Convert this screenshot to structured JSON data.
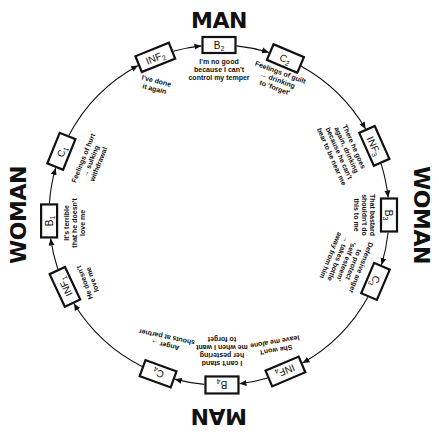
{
  "center": {
    "x": 219,
    "y": 215
  },
  "radius": 170,
  "colors": {
    "ink": "#111111",
    "background": "#ffffff"
  },
  "party_labels": [
    {
      "id": "top",
      "text": "MAN",
      "x": 219,
      "y": 22,
      "rotate": 0
    },
    {
      "id": "right",
      "text": "WOMAN",
      "x": 420,
      "y": 215,
      "rotate": 90
    },
    {
      "id": "bottom",
      "text": "MAN",
      "x": 219,
      "y": 415,
      "rotate": 180
    },
    {
      "id": "left",
      "text": "WOMAN",
      "x": 20,
      "y": 215,
      "rotate": -90
    }
  ],
  "nodes": [
    {
      "id": "INF2",
      "letter": "INF",
      "sub": "2",
      "angle": 248,
      "rotate": -22,
      "w": 36,
      "h": 17,
      "caption": [
        "I've done",
        "it again"
      ],
      "caption_dx": 0,
      "caption_dy": 28,
      "caption_rotate": 14
    },
    {
      "id": "B2",
      "letter": "B",
      "sub": "2",
      "angle": -90,
      "rotate": 0,
      "w": 33,
      "h": 16,
      "caption": [
        "I'm no good",
        "because I can't",
        "control my temper"
      ],
      "caption_dx": 0,
      "caption_dy": 25,
      "caption_rotate": 0
    },
    {
      "id": "C2",
      "letter": "C",
      "sub": "2",
      "angle": -67,
      "rotate": 23,
      "w": 33,
      "h": 17,
      "caption": [
        "Feelings of guilt",
        "→ drinking",
        "to 'forget'"
      ],
      "caption_dx": -8,
      "caption_dy": 22,
      "caption_rotate": 20
    },
    {
      "id": "INF3",
      "letter": "INF",
      "sub": "3",
      "angle": -24,
      "rotate": 66,
      "w": 36,
      "h": 17,
      "caption": [
        "There he goes",
        "again, drinking",
        "because he can't",
        "bear to be near me"
      ],
      "caption_dx": -32,
      "caption_dy": 6,
      "caption_rotate": 66
    },
    {
      "id": "B3",
      "letter": "B",
      "sub": "3",
      "angle": 0,
      "rotate": 90,
      "w": 33,
      "h": 16,
      "caption": [
        "That bastard",
        "shouldn't do",
        "this to me"
      ],
      "caption_dx": -25,
      "caption_dy": 0,
      "caption_rotate": 90
    },
    {
      "id": "C3",
      "letter": "C",
      "sub": "3",
      "angle": 23,
      "rotate": 113,
      "w": 33,
      "h": 17,
      "caption": [
        "Defensive anger",
        "to protect",
        "'self esteem'",
        "→ takes bottle",
        "away from him"
      ],
      "caption_dx": -30,
      "caption_dy": -20,
      "caption_rotate": 112
    },
    {
      "id": "INF4",
      "letter": "INF",
      "sub": "4",
      "angle": 67,
      "rotate": 157,
      "w": 36,
      "h": 17,
      "caption": [
        "She won't",
        "leave me alone"
      ],
      "caption_dx": -10,
      "caption_dy": -26,
      "caption_rotate": 170
    },
    {
      "id": "B4",
      "letter": "B",
      "sub": "4",
      "angle": 89,
      "rotate": 180,
      "w": 33,
      "h": 17,
      "caption": [
        "I can't stand",
        "her pestering",
        "me when I want",
        "to forget"
      ],
      "caption_dx": 0,
      "caption_dy": -34,
      "caption_rotate": 180
    },
    {
      "id": "C4",
      "letter": "C",
      "sub": "4",
      "angle": 111,
      "rotate": 200,
      "w": 33,
      "h": 17,
      "caption": [
        "Anger →",
        "shouts at partner"
      ],
      "caption_dx": 8,
      "caption_dy": -33,
      "caption_rotate": 192
    },
    {
      "id": "INF1",
      "letter": "INF",
      "sub": "1",
      "angle": 155,
      "rotate": 245,
      "w": 36,
      "h": 17,
      "caption": [
        "He doesn't",
        "love me"
      ],
      "caption_dx": 24,
      "caption_dy": -6,
      "caption_rotate": 250
    },
    {
      "id": "B1",
      "letter": "B",
      "sub": "1",
      "angle": 178,
      "rotate": 270,
      "w": 33,
      "h": 16,
      "caption": [
        "It's terrible",
        "that he doesn't",
        "love me"
      ],
      "caption_dx": 26,
      "caption_dy": 2,
      "caption_rotate": 270
    },
    {
      "id": "C1",
      "letter": "C",
      "sub": "1",
      "angle": 202,
      "rotate": 292,
      "w": 33,
      "h": 17,
      "caption": [
        "Feelings of hurt",
        "→ sulking",
        "withdrawal"
      ],
      "caption_dx": 30,
      "caption_dy": 10,
      "caption_rotate": 292
    }
  ]
}
